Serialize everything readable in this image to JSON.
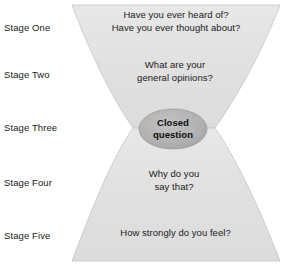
{
  "diagram": {
    "type": "funnel-hourglass",
    "colors": {
      "funnel_fill": "#e3e3e3",
      "funnel_stroke": "#bcbcbc",
      "ellipse_fill": "#b3b3b3",
      "ellipse_stroke": "#8f8f8f",
      "text": "#1a1a1a",
      "background": "#ffffff"
    },
    "stages": [
      {
        "label": "Stage One"
      },
      {
        "label": "Stage Two"
      },
      {
        "label": "Stage Three"
      },
      {
        "label": "Stage Four"
      },
      {
        "label": "Stage Five"
      }
    ],
    "funnel_content": [
      {
        "stage": "Stage One",
        "lines": [
          "Have you ever heard of?",
          "Have you ever thought about?"
        ]
      },
      {
        "stage": "Stage Two",
        "lines": [
          "What are your",
          "general opinions?"
        ]
      },
      {
        "stage": "Stage Four",
        "lines": [
          "Why do you",
          "say that?"
        ]
      },
      {
        "stage": "Stage Five",
        "lines": [
          "How strongly do you feel?"
        ]
      }
    ],
    "waist_node": {
      "shape": "ellipse",
      "lines": [
        "Closed",
        "question"
      ]
    }
  }
}
